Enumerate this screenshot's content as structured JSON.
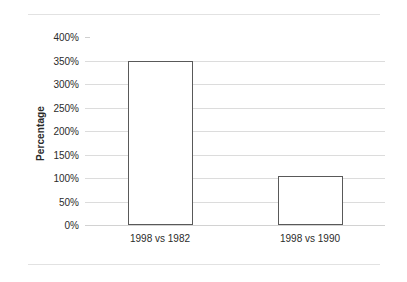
{
  "chart_data": {
    "type": "bar",
    "title": "",
    "xlabel": "",
    "ylabel": "Percentage",
    "categories": [
      "1998 vs 1982",
      "1998 vs 1990"
    ],
    "values": [
      350,
      105
    ],
    "value_labels": [
      "350%",
      "105%"
    ],
    "ylim": [
      0,
      400
    ],
    "ytick_step": 50,
    "ytick_labels": [
      "400%",
      "350%",
      "300%",
      "250%",
      "200%",
      "150%",
      "100%",
      "50%",
      "0%"
    ],
    "ytick_values": [
      400,
      350,
      300,
      250,
      200,
      150,
      100,
      50,
      0
    ],
    "gridline_values": [
      350,
      300,
      250,
      200,
      150,
      100,
      50,
      0
    ],
    "grid": true,
    "legend": false,
    "legend_position": "none",
    "series": [
      {
        "name": "Percentage",
        "values": [
          350,
          105
        ],
        "bar_fill": "#ffffff",
        "bar_outline": "#595959"
      }
    ]
  },
  "style": {
    "background": "#ffffff",
    "grid_color": "#dcdcdc",
    "text_color": "#2b2b2b",
    "rule_color": "#e2e2e2",
    "bar_outline_color": "#595959",
    "bar_fill_color": "#ffffff"
  }
}
